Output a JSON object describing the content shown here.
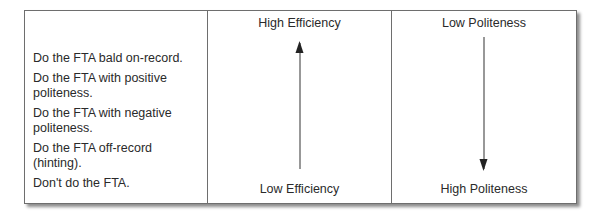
{
  "strategies": [
    "Do the FTA bald on-record.",
    "Do the FTA with positive politeness.",
    "Do the FTA with negative politeness.",
    "Do the FTA off-record (hinting).",
    "Don't do the FTA."
  ],
  "efficiency": {
    "top_label": "High Efficiency",
    "bottom_label": "Low Efficiency",
    "arrow_direction": "up",
    "arrow_icon": "arrow-up-icon"
  },
  "politeness": {
    "top_label": "Low Politeness",
    "bottom_label": "High Politeness",
    "arrow_direction": "down",
    "arrow_icon": "arrow-down-icon"
  },
  "colors": {
    "border": "#6e6e6e",
    "text": "#2a2a2a",
    "arrow": "#222222"
  }
}
